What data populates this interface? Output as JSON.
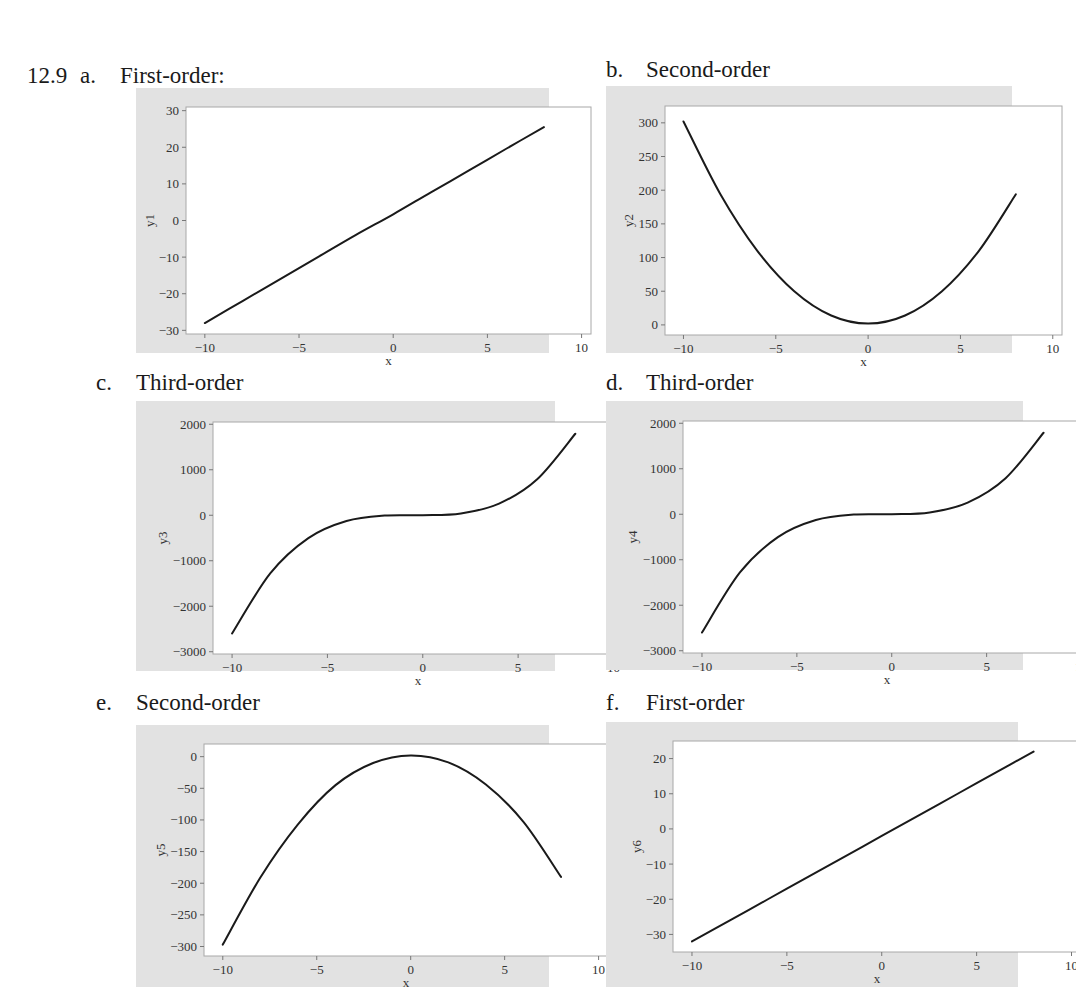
{
  "problem_number": "12.9",
  "panels": [
    {
      "letter": "a.",
      "title": "First-order:"
    },
    {
      "letter": "b.",
      "title": "Second-order"
    },
    {
      "letter": "c.",
      "title": "Third-order"
    },
    {
      "letter": "d.",
      "title": "Third-order"
    },
    {
      "letter": "e.",
      "title": "Second-order"
    },
    {
      "letter": "f.",
      "title": "First-order"
    }
  ],
  "chart_data": [
    {
      "type": "line",
      "title": "First-order:",
      "xlabel": "x",
      "ylabel": "y1",
      "xlim": [
        -11,
        10.5
      ],
      "ylim": [
        -31,
        31
      ],
      "xticks": [
        -10,
        -5,
        0,
        5,
        10
      ],
      "yticks": [
        -30,
        -20,
        -10,
        0,
        10,
        20,
        30
      ],
      "x": [
        -10,
        -8,
        -6,
        -4,
        -2,
        0,
        2,
        4,
        6,
        8
      ],
      "values": [
        -28,
        -22,
        -16,
        -10,
        -4,
        1.7,
        7.7,
        13.6,
        19.6,
        25.5
      ],
      "grid": false,
      "legend": null
    },
    {
      "type": "line",
      "title": "Second-order",
      "xlabel": "x",
      "ylabel": "y2",
      "xlim": [
        -11,
        10.5
      ],
      "ylim": [
        -15,
        325
      ],
      "xticks": [
        -10,
        -5,
        0,
        5,
        10
      ],
      "yticks": [
        0,
        50,
        100,
        150,
        200,
        250,
        300
      ],
      "x": [
        -10,
        -8,
        -6,
        -4,
        -2,
        0,
        2,
        4,
        6,
        8
      ],
      "values": [
        302,
        194,
        110,
        50,
        14,
        2,
        14,
        50,
        110,
        194
      ],
      "grid": false,
      "legend": null
    },
    {
      "type": "line",
      "title": "Third-order",
      "xlabel": "x",
      "ylabel": "y3",
      "xlim": [
        -11,
        10.5
      ],
      "ylim": [
        -3050,
        2050
      ],
      "xticks": [
        -10,
        -5,
        0,
        5,
        10
      ],
      "yticks": [
        -3000,
        -2000,
        -1000,
        0,
        1000,
        2000
      ],
      "x": [
        -10,
        -8,
        -6,
        -4,
        -2,
        0,
        2,
        4,
        6,
        8
      ],
      "values": [
        -2600,
        -1280,
        -504,
        -128,
        -8,
        0,
        40,
        256,
        792,
        1792
      ],
      "grid": false,
      "legend": null
    },
    {
      "type": "line",
      "title": "Third-order",
      "xlabel": "x",
      "ylabel": "y4",
      "xlim": [
        -11,
        10.5
      ],
      "ylim": [
        -3050,
        2050
      ],
      "xticks": [
        -10,
        -5,
        0,
        5,
        10
      ],
      "yticks": [
        -3000,
        -2000,
        -1000,
        0,
        1000,
        2000
      ],
      "x": [
        -10,
        -8,
        -6,
        -4,
        -2,
        0,
        2,
        4,
        6,
        8
      ],
      "values": [
        -2600,
        -1280,
        -504,
        -128,
        -8,
        0,
        40,
        256,
        792,
        1792
      ],
      "grid": false,
      "legend": null
    },
    {
      "type": "line",
      "title": "Second-order",
      "xlabel": "x",
      "ylabel": "y5",
      "xlim": [
        -11,
        10.5
      ],
      "ylim": [
        -315,
        20
      ],
      "xticks": [
        -10,
        -5,
        0,
        5,
        10
      ],
      "yticks": [
        -300,
        -250,
        -200,
        -150,
        -100,
        -50,
        0
      ],
      "x": [
        -10,
        -8,
        -6,
        -4,
        -2,
        0,
        2,
        4,
        6,
        8
      ],
      "values": [
        -297,
        -191,
        -107,
        -45,
        -10,
        2,
        -9,
        -44,
        -103,
        -190
      ],
      "grid": false,
      "legend": null
    },
    {
      "type": "line",
      "title": "First-order",
      "xlabel": "x",
      "ylabel": "y6",
      "xlim": [
        -11,
        10.5
      ],
      "ylim": [
        -35,
        25
      ],
      "xticks": [
        -10,
        -5,
        0,
        5,
        10
      ],
      "yticks": [
        -30,
        -20,
        -10,
        0,
        10,
        20
      ],
      "x": [
        -10,
        -8,
        -6,
        -4,
        -2,
        0,
        2,
        4,
        6,
        8
      ],
      "values": [
        -32,
        -26,
        -20,
        -14,
        -8,
        -2,
        4,
        10,
        16,
        22
      ],
      "grid": false,
      "legend": null
    }
  ]
}
